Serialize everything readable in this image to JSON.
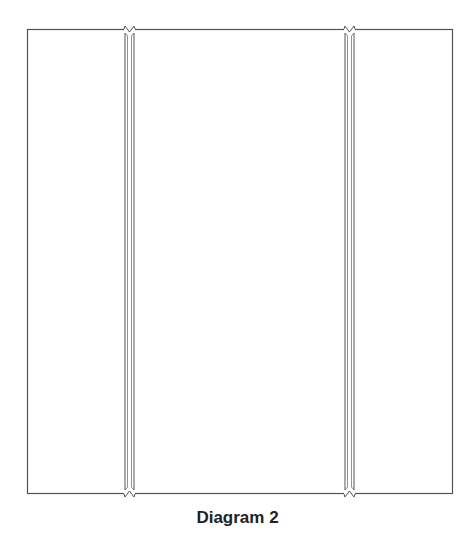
{
  "diagram": {
    "caption": "Diagram 2",
    "outline": {
      "x": 27,
      "y": 29,
      "width": 426,
      "height": 465
    },
    "strips": [
      {
        "name": "left-strip",
        "x": 124,
        "width": 11
      },
      {
        "name": "right-strip",
        "x": 344,
        "width": 11
      }
    ],
    "colors": {
      "stroke": "#555555",
      "background": "#ffffff",
      "caption": "#222222"
    }
  }
}
